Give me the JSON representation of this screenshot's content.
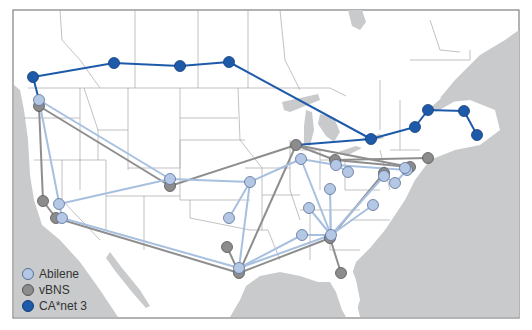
{
  "legend": {
    "items": [
      {
        "label": "Abilene",
        "color": "#b4c8e6",
        "stroke": "#5a6e96"
      },
      {
        "label": "vBNS",
        "color": "#8c8c8c",
        "stroke": "#555555"
      },
      {
        "label": "CA*net 3",
        "color": "#1e5aaa",
        "stroke": "#123c78"
      }
    ]
  },
  "colors": {
    "land": "#ffffff",
    "water": "#c8cacb",
    "border": "#a0a0a0",
    "frame": "#808080",
    "abilene_line": "#a8c0e0",
    "vbns_line": "#8e8e8e",
    "canet_line": "#1e5aaa"
  },
  "networks": {
    "canet": {
      "nodes": [
        [
          33,
          77
        ],
        [
          114,
          63
        ],
        [
          180,
          66
        ],
        [
          229,
          62
        ],
        [
          371,
          139
        ],
        [
          415,
          127
        ],
        [
          428,
          110
        ],
        [
          464,
          111
        ],
        [
          477,
          135
        ]
      ],
      "links": [
        [
          0,
          1
        ],
        [
          1,
          2
        ],
        [
          2,
          3
        ],
        [
          3,
          4
        ],
        [
          4,
          5
        ],
        [
          5,
          6
        ],
        [
          6,
          7
        ],
        [
          7,
          8
        ],
        [
          0,
          "a0"
        ],
        [
          4,
          "v1"
        ]
      ]
    },
    "abilene": {
      "nodes": [
        [
          39,
          100
        ],
        [
          170,
          179
        ],
        [
          250,
          182
        ],
        [
          229,
          218
        ],
        [
          59,
          204
        ],
        [
          62,
          218
        ],
        [
          239,
          268
        ],
        [
          301,
          159
        ],
        [
          336,
          165
        ],
        [
          348,
          172
        ],
        [
          330,
          189
        ],
        [
          309,
          208
        ],
        [
          331,
          235
        ],
        [
          302,
          235
        ],
        [
          384,
          176
        ],
        [
          395,
          183
        ],
        [
          407,
          170
        ],
        [
          405,
          168
        ],
        [
          373,
          205
        ]
      ],
      "links": [
        [
          0,
          1
        ],
        [
          0,
          5
        ],
        [
          1,
          2
        ],
        [
          1,
          4
        ],
        [
          2,
          3
        ],
        [
          2,
          6
        ],
        [
          2,
          7
        ],
        [
          5,
          6
        ],
        [
          7,
          8
        ],
        [
          7,
          12
        ],
        [
          8,
          9
        ],
        [
          8,
          16
        ],
        [
          10,
          12
        ],
        [
          11,
          12
        ],
        [
          12,
          13
        ],
        [
          12,
          14
        ],
        [
          12,
          6
        ],
        [
          13,
          6
        ],
        [
          14,
          15
        ],
        [
          15,
          16
        ],
        [
          18,
          12
        ]
      ]
    },
    "vbns": {
      "nodes": [
        [
          39,
          106
        ],
        [
          296,
          145
        ],
        [
          170,
          186
        ],
        [
          43,
          201
        ],
        [
          56,
          218
        ],
        [
          227,
          247
        ],
        [
          239,
          273
        ],
        [
          330,
          238
        ],
        [
          341,
          273
        ],
        [
          335,
          160
        ],
        [
          384,
          173
        ],
        [
          428,
          158
        ],
        [
          410,
          167
        ]
      ],
      "links": [
        [
          0,
          2
        ],
        [
          0,
          3
        ],
        [
          2,
          1
        ],
        [
          3,
          4
        ],
        [
          4,
          6
        ],
        [
          5,
          6
        ],
        [
          6,
          1
        ],
        [
          6,
          7
        ],
        [
          7,
          10
        ],
        [
          7,
          8
        ],
        [
          1,
          9
        ],
        [
          9,
          11
        ],
        [
          9,
          12
        ],
        [
          1,
          12
        ]
      ]
    }
  }
}
